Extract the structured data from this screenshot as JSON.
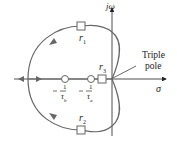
{
  "diagram": {
    "type": "root-locus",
    "axes": {
      "vertical": "jω",
      "horizontal": "σ"
    },
    "annotation": {
      "line1": "Triple",
      "line2": "pole"
    },
    "roots": {
      "r1": "r",
      "r1_sub": "1",
      "r2": "r",
      "r2_sub": "2",
      "r3": "r",
      "r3_sub": "3"
    },
    "zeros": {
      "zb": {
        "minus": "−",
        "num": "1",
        "den": "τ",
        "den_sub": "b"
      },
      "za": {
        "minus": "−",
        "num": "1",
        "den": "τ",
        "den_sub": "a"
      }
    },
    "colors": {
      "locus": "#666666",
      "axis": "#222222",
      "marker_fill": "#ffffff"
    }
  }
}
